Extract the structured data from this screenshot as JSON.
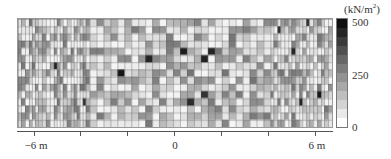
{
  "chart_data": {
    "type": "heatmap",
    "title": "",
    "xlabel": "",
    "ylabel": "",
    "x_ticks": [
      {
        "pos": -6,
        "label": "−6 m"
      },
      {
        "pos": -4,
        "label": ""
      },
      {
        "pos": -2,
        "label": ""
      },
      {
        "pos": 0,
        "label": "0"
      },
      {
        "pos": 2,
        "label": ""
      },
      {
        "pos": 4,
        "label": ""
      },
      {
        "pos": 6,
        "label": "6 m"
      }
    ],
    "xlim": [
      -6.7,
      6.7
    ],
    "rows": 15,
    "colorbar": {
      "unit": "(kN/m²)",
      "min": 0,
      "max": 500,
      "ticks": [
        {
          "value": 500,
          "label": "500"
        },
        {
          "value": 250,
          "label": "250"
        },
        {
          "value": 0,
          "label": "0"
        }
      ],
      "steps": 12,
      "colormap": "gray_r"
    }
  },
  "labels": {
    "unit_main": "(kN/m",
    "unit_sup": "2",
    "unit_close": ")",
    "cb_500": "500",
    "cb_250": "250",
    "cb_0": "0",
    "x_neg6": "−6 m",
    "x_0": "0",
    "x_6": "6 m"
  }
}
